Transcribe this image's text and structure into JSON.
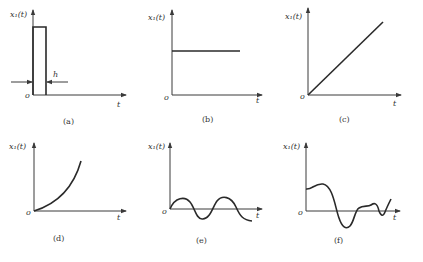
{
  "figure": {
    "panels": [
      {
        "id": "a",
        "caption": "(a)",
        "ylabel": "x₁(t)",
        "xlabel": "t",
        "origin": "o",
        "annotation": "h",
        "shape": "rectangular pulse of width h"
      },
      {
        "id": "b",
        "caption": "(b)",
        "ylabel": "x₁(t)",
        "xlabel": "t",
        "origin": "o",
        "shape": "constant (step)"
      },
      {
        "id": "c",
        "caption": "(c)",
        "ylabel": "x₁(t)",
        "xlabel": "t",
        "origin": "o",
        "shape": "ramp (linear increase)"
      },
      {
        "id": "d",
        "caption": "(d)",
        "ylabel": "x₁(t)",
        "xlabel": "t",
        "origin": "o",
        "shape": "accelerating (parabolic) increase"
      },
      {
        "id": "e",
        "caption": "(e)",
        "ylabel": "x₁(t)",
        "xlabel": "t",
        "origin": "o",
        "shape": "sinusoid"
      },
      {
        "id": "f",
        "caption": "(f)",
        "ylabel": "x₁(t)",
        "xlabel": "t",
        "origin": "o",
        "shape": "random / irregular signal"
      }
    ]
  }
}
